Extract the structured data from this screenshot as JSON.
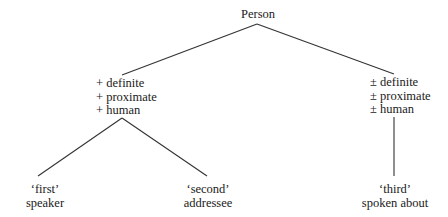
{
  "diagram": {
    "type": "tree",
    "root": {
      "label": "Person"
    },
    "branches": [
      {
        "features": [
          "+ definite",
          "+ proximate",
          "+ human"
        ],
        "children": [
          {
            "gloss": "‘first’",
            "meaning": "speaker"
          },
          {
            "gloss": "‘second’",
            "meaning": "addressee"
          }
        ]
      },
      {
        "features": [
          "± definite",
          "± proximate",
          "± human"
        ],
        "children": [
          {
            "gloss": "‘third’",
            "meaning": "spoken about"
          }
        ]
      }
    ],
    "colors": {
      "line": "#333333",
      "text": "#1a1a1a",
      "background": "#ffffff"
    }
  }
}
